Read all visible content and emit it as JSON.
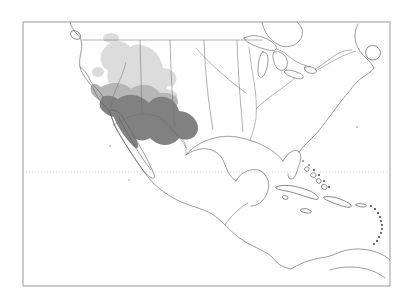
{
  "figure": {
    "kind": "distribution-range-map",
    "region": "North America and Central America",
    "background_color": "#ffffff",
    "frame": {
      "x": 23,
      "y": 22,
      "width": 367,
      "height": 264,
      "stroke_color": "#9a9a9a"
    }
  },
  "graticule": {
    "lines": [
      {
        "name": "tropic-of-cancer",
        "orientation": "horizontal",
        "y": 172,
        "style": "dotted",
        "color": "#c9c9c9"
      }
    ]
  },
  "range_zones": [
    {
      "id": "zone-light",
      "label": "",
      "color": "#dcdcdc",
      "extent": "Great Basin, Colorado Plateau, southern Rocky Mountains, Great Plains edge",
      "texture": "stippled"
    },
    {
      "id": "zone-medium",
      "label": "",
      "color": "#b6b6b6",
      "extent": "Mojave and Sonoran transition, southern Arizona and New Mexico",
      "texture": "solid"
    },
    {
      "id": "zone-dark",
      "label": "",
      "color": "#818181",
      "extent": "Sierra Madre Occidental, Mexican Plateau, Sierra Madre Oriental",
      "texture": "solid"
    }
  ],
  "map_features": {
    "coastlines": "North American Pacific and Atlantic coasts, Gulf of Mexico, Baja California peninsula, Yucatan peninsula, Central American isthmus",
    "lakes": "Great Lakes",
    "islands": [
      "Cuba",
      "Hispaniola",
      "Jamaica",
      "Puerto Rico",
      "Bahamas",
      "Lesser Antilles",
      "Newfoundland",
      "Vancouver Island"
    ],
    "internal_borders": "United States state and national boundaries"
  }
}
